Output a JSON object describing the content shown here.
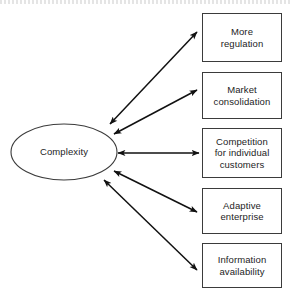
{
  "diagram": {
    "type": "concept-map",
    "center_node": {
      "label": "Complexity",
      "shape": "ellipse"
    },
    "nodes": [
      {
        "id": "more-regulation",
        "label": "More\nregulation",
        "shape": "rectangle"
      },
      {
        "id": "market-consolidation",
        "label": "Market\nconsolidation",
        "shape": "rectangle"
      },
      {
        "id": "competition",
        "label": "Competition\nfor individual\ncustomers",
        "shape": "rectangle"
      },
      {
        "id": "adaptive-enterprise",
        "label": "Adaptive\nenterprise",
        "shape": "rectangle"
      },
      {
        "id": "information-availability",
        "label": "Information\navailability",
        "shape": "rectangle"
      }
    ],
    "edges": [
      {
        "from": "Complexity",
        "to": "More regulation",
        "direction": "bidirectional"
      },
      {
        "from": "Complexity",
        "to": "Market consolidation",
        "direction": "bidirectional"
      },
      {
        "from": "Complexity",
        "to": "Competition for individual customers",
        "direction": "bidirectional"
      },
      {
        "from": "Complexity",
        "to": "Adaptive enterprise",
        "direction": "bidirectional"
      },
      {
        "from": "Complexity",
        "to": "Information availability",
        "direction": "bidirectional"
      }
    ],
    "colors": {
      "stroke": "#3b3b3b",
      "text": "#1d1d1d",
      "background": "#ffffff",
      "arrow": "#111111"
    }
  }
}
